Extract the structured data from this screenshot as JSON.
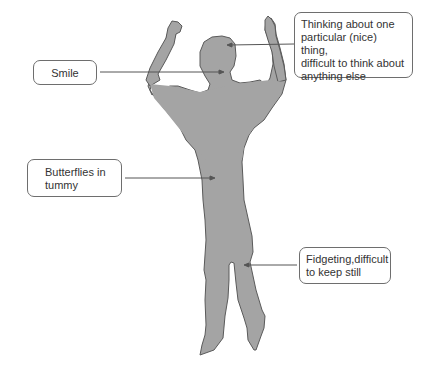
{
  "diagram": {
    "type": "annotated-figure",
    "figure_color": "#a4a4a4",
    "outline_color": "#5a5a5a",
    "line_color": "#555555",
    "callouts": [
      {
        "id": "think",
        "lines": [
          "Thinking about one",
          "particular (nice) thing,",
          "difficult to think about",
          "anything else"
        ],
        "points_to": "head"
      },
      {
        "id": "smile",
        "lines": [
          "Smile"
        ],
        "points_to": "mouth"
      },
      {
        "id": "butterflies",
        "lines": [
          "Butterflies in",
          "tummy"
        ],
        "points_to": "stomach"
      },
      {
        "id": "fidget",
        "lines": [
          "Fidgeting,difficult",
          "to keep still"
        ],
        "points_to": "legs"
      }
    ]
  }
}
